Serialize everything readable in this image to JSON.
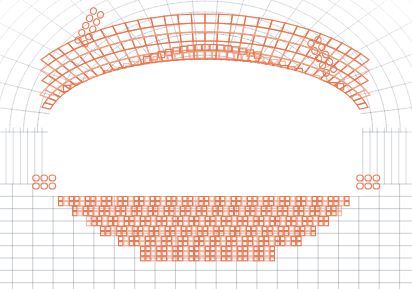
{
  "figure": {
    "width": 412,
    "height": 289,
    "background_color": "#ffffff"
  },
  "colors": {
    "background_mesh": "#6f7b8c",
    "background_mesh_faint": "#c9ced6",
    "highlight_mesh": "#e8724a",
    "highlight_mesh_light": "#f2a184",
    "bolt_marker": "#e07a55",
    "excavation_fill": "#ffffff"
  },
  "legend": {
    "background_mesh_label": "far-field rock mesh",
    "highlight_mesh_label": "yielded / lining zone elements",
    "bolt_marker_label": "rock bolt markers",
    "opening_label": "tunnel excavation opening"
  },
  "background_mesh": {
    "type": "curvilinear-quad",
    "radial_lines": 21,
    "circumferential_lines": 17,
    "line_width": 0.6,
    "opacity": 0.55,
    "corner_fade": true
  },
  "opening": {
    "type": "horseshoe",
    "crown_y": 122,
    "springline_y": 186,
    "invert_y": 196,
    "left_x": 48,
    "right_x": 362,
    "arch_rise": 62
  },
  "lining_band": {
    "description": "concentric arch band of quad elements above the opening",
    "rings": 5,
    "cells_per_ring": 46,
    "crown_top_y": 44,
    "crown_bottom_y": 118,
    "left_toe_x": 52,
    "right_toe_x": 358
  },
  "floor_zone": {
    "description": "stepped yielded zone beneath invert",
    "top_y": 196,
    "bottom_y": 258,
    "left_x": 58,
    "right_x": 356,
    "steps": [
      {
        "x0": 58,
        "x1": 352,
        "y0": 196,
        "y1": 206
      },
      {
        "x0": 72,
        "x1": 342,
        "y0": 206,
        "y1": 216
      },
      {
        "x0": 86,
        "x1": 330,
        "y0": 216,
        "y1": 226
      },
      {
        "x0": 100,
        "x1": 316,
        "y0": 226,
        "y1": 236
      },
      {
        "x0": 118,
        "x1": 300,
        "y0": 236,
        "y1": 246
      },
      {
        "x0": 140,
        "x1": 278,
        "y0": 246,
        "y1": 258
      }
    ]
  },
  "bolt_clusters": [
    {
      "name": "upper-left-bolt-row",
      "x": 78,
      "y": 40,
      "rows": 2,
      "cols": 5,
      "angle": -62
    },
    {
      "name": "upper-right-bolt-row",
      "x": 318,
      "y": 40,
      "rows": 2,
      "cols": 5,
      "angle": 62
    },
    {
      "name": "left-springline-bolt-cluster",
      "x": 36,
      "y": 178,
      "rows": 2,
      "cols": 3,
      "angle": 0
    },
    {
      "name": "right-springline-bolt-cluster",
      "x": 360,
      "y": 178,
      "rows": 2,
      "cols": 3,
      "angle": 0
    }
  ]
}
